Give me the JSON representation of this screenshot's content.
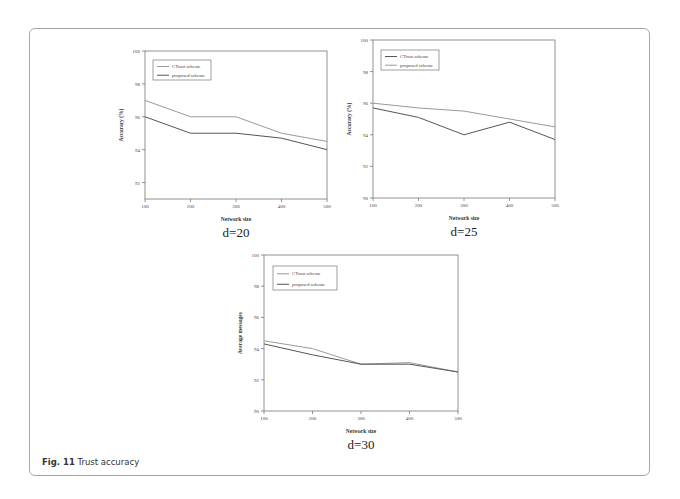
{
  "figure": {
    "caption_label": "Fig. 11",
    "caption_text": "Trust accuracy"
  },
  "chart_data": [
    {
      "type": "line",
      "title": "",
      "subtitle": "d=20",
      "xlabel": "Network size",
      "ylabel": "Accuracy (%)",
      "x": [
        100,
        200,
        300,
        400,
        500
      ],
      "xticks": [
        "100",
        "200",
        "300",
        "400",
        "500"
      ],
      "yticks": [
        "92",
        "94",
        "96",
        "98",
        "100"
      ],
      "ylim": [
        91,
        100
      ],
      "grid": false,
      "legend_position": "upper-left",
      "series": [
        {
          "name": "CTrust scheme",
          "color": "#9a9a9a",
          "values": [
            97.0,
            96.0,
            96.0,
            95.0,
            94.5
          ]
        },
        {
          "name": "proposed scheme",
          "color": "#555555",
          "values": [
            96.0,
            95.0,
            95.0,
            94.7,
            94.0
          ]
        }
      ]
    },
    {
      "type": "line",
      "title": "",
      "subtitle": "d=25",
      "xlabel": "Network size",
      "ylabel": "Accuracy (%)",
      "x": [
        100,
        200,
        300,
        400,
        500
      ],
      "xticks": [
        "100",
        "200",
        "300",
        "400",
        "500"
      ],
      "yticks": [
        "90",
        "92",
        "94",
        "96",
        "98",
        "100"
      ],
      "ylim": [
        90,
        100
      ],
      "grid": false,
      "legend_position": "upper-left",
      "series": [
        {
          "name": "CTrust scheme",
          "color": "#555555",
          "values": [
            95.7,
            95.1,
            94.0,
            94.8,
            93.7
          ]
        },
        {
          "name": "proposed scheme",
          "color": "#9a9a9a",
          "values": [
            96.0,
            95.7,
            95.5,
            95.0,
            94.5
          ]
        }
      ]
    },
    {
      "type": "line",
      "title": "",
      "subtitle": "d=30",
      "xlabel": "Network size",
      "ylabel": "Average messages",
      "x": [
        100,
        200,
        300,
        400,
        500
      ],
      "xticks": [
        "100",
        "200",
        "300",
        "400",
        "500"
      ],
      "yticks": [
        "90",
        "92",
        "94",
        "96",
        "98",
        "100"
      ],
      "ylim": [
        90,
        100
      ],
      "grid": false,
      "legend_position": "upper-left",
      "series": [
        {
          "name": "CTrust scheme",
          "color": "#9a9a9a",
          "values": [
            94.5,
            94.0,
            93.0,
            93.1,
            92.5
          ]
        },
        {
          "name": "proposed scheme",
          "color": "#555555",
          "values": [
            94.3,
            93.6,
            93.0,
            93.0,
            92.5
          ]
        }
      ]
    }
  ],
  "layout": [
    {
      "x0": 145,
      "x1": 327,
      "yTop": 51,
      "yBot": 199,
      "legend": {
        "x": 153,
        "y": 60,
        "w": 58,
        "h": 20
      }
    },
    {
      "x0": 373,
      "x1": 555,
      "yTop": 40,
      "yBot": 198,
      "legend": {
        "x": 381,
        "y": 50,
        "w": 58,
        "h": 20
      }
    },
    {
      "x0": 264,
      "x1": 458,
      "yTop": 255,
      "yBot": 411,
      "legend": {
        "x": 273,
        "y": 266,
        "w": 64,
        "h": 24
      }
    }
  ]
}
